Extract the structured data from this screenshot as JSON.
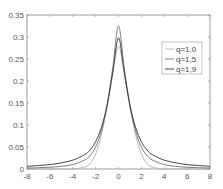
{
  "chart_data": {
    "type": "line",
    "title": "",
    "xlabel": "",
    "ylabel": "",
    "xlim": [
      -8,
      8
    ],
    "ylim": [
      0,
      0.35
    ],
    "grid": false,
    "legend_position": "upper-right",
    "x_ticks": [
      "-8",
      "-6",
      "-4",
      "-2",
      "0",
      "2",
      "4",
      "6",
      "8"
    ],
    "y_ticks": [
      "0",
      "0.05",
      "0.1",
      "0.15",
      "0.2",
      "0.25",
      "0.3",
      "0.35"
    ],
    "x": [
      -8,
      -7,
      -6,
      -5,
      -4,
      -3,
      -2.5,
      -2,
      -1.5,
      -1,
      -0.5,
      0,
      0.5,
      1,
      1.5,
      2,
      2.5,
      3,
      4,
      5,
      6,
      7,
      8
    ],
    "series": [
      {
        "name": "q=1,0",
        "color": "#b0b0b0",
        "values": [
          0.0,
          0.0,
          0.0,
          0.0,
          0.0,
          0.004,
          0.012,
          0.034,
          0.077,
          0.14,
          0.218,
          0.28,
          0.218,
          0.14,
          0.077,
          0.034,
          0.012,
          0.004,
          0.0,
          0.0,
          0.0,
          0.0,
          0.0
        ]
      },
      {
        "name": "q=1,5",
        "color": "#707070",
        "values": [
          0.002,
          0.003,
          0.004,
          0.006,
          0.01,
          0.02,
          0.03,
          0.05,
          0.086,
          0.145,
          0.23,
          0.325,
          0.23,
          0.145,
          0.086,
          0.05,
          0.03,
          0.02,
          0.01,
          0.006,
          0.004,
          0.003,
          0.002
        ]
      },
      {
        "name": "q=1,9",
        "color": "#303030",
        "values": [
          0.006,
          0.008,
          0.01,
          0.014,
          0.02,
          0.032,
          0.043,
          0.062,
          0.094,
          0.145,
          0.22,
          0.298,
          0.22,
          0.145,
          0.094,
          0.062,
          0.043,
          0.032,
          0.02,
          0.014,
          0.01,
          0.008,
          0.006
        ]
      }
    ]
  }
}
